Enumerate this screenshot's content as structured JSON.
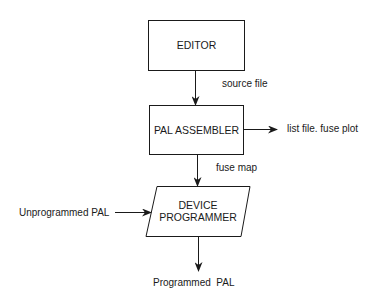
{
  "diagram": {
    "type": "flowchart",
    "nodes": [
      {
        "id": "editor",
        "label": "EDITOR",
        "shape": "rectangle"
      },
      {
        "id": "pal_assembler",
        "label": "PAL ASSEMBLER",
        "shape": "rectangle"
      },
      {
        "id": "device_programmer",
        "label_line1": "DEVICE",
        "label_line2": "PROGRAMMER",
        "shape": "parallelogram"
      }
    ],
    "edges": [
      {
        "from": "editor",
        "to": "pal_assembler",
        "label": "source file"
      },
      {
        "from": "pal_assembler",
        "to": "output_list",
        "label": "list file. fuse plot"
      },
      {
        "from": "pal_assembler",
        "to": "device_programmer",
        "label": "fuse map"
      },
      {
        "from": "input_pal",
        "to": "device_programmer",
        "label": "Unprogrammed PAL"
      },
      {
        "from": "device_programmer",
        "to": "output_pal",
        "label": "Programmed  PAL"
      }
    ]
  },
  "colors": {
    "line": "#1a1a1a",
    "background": "#ffffff"
  }
}
